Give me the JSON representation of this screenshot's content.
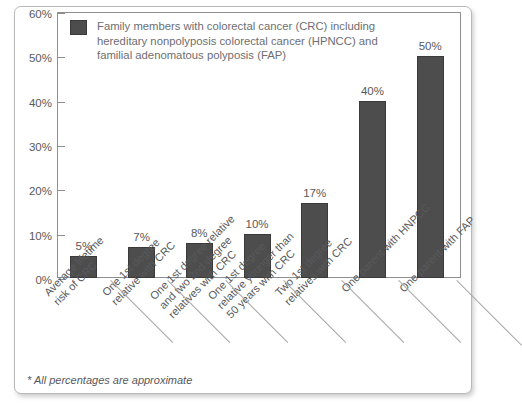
{
  "chart_data": {
    "type": "bar",
    "title": "",
    "xlabel": "",
    "ylabel": "",
    "ylim": [
      0,
      60
    ],
    "grid": false,
    "legend_position": "top-left",
    "bar_color": "#4d4d4d",
    "categories": [
      "Average lifetime risk of CRC",
      "One 1st degree relative with CRC",
      "One 1st degree relative and two 2nd degree relatives with CRC",
      "One 1st degree relative younger than 50 years with CRC",
      "Two 1st degree relatives with CRC",
      "One parent with HNPCC",
      "One parent with FAP"
    ],
    "category_lines": [
      [
        "Average lifetime",
        "risk of CRC"
      ],
      [
        "One 1st degree",
        "relative with CRC"
      ],
      [
        "One 1st degree relative",
        "and two 2nd degree",
        "relatives with CRC"
      ],
      [
        "One 1st degree",
        "relative younger than",
        "50 years with CRC"
      ],
      [
        "Two 1st degree",
        "relatives with CRC"
      ],
      [
        "One parent with HNPCC"
      ],
      [
        "One parent with FAP"
      ]
    ],
    "values": [
      5,
      7,
      8,
      10,
      17,
      40,
      50
    ],
    "value_labels": [
      "5%",
      "7%",
      "8%",
      "10%",
      "17%",
      "40%",
      "50%"
    ],
    "ytick_values": [
      0,
      10,
      20,
      30,
      40,
      50,
      60
    ],
    "ytick_labels": [
      "0%",
      "10%",
      "20%",
      "30%",
      "40%",
      "50%",
      "60%"
    ],
    "legend": [
      {
        "label": "Family members with colorectal cancer (CRC) including hereditary nonpolyposis colorectal cancer (HPNCC) and familial adenomatous polyposis (FAP)",
        "lines": [
          "Family members with colorectal cancer (CRC) including",
          "hereditary nonpolyposis colorectal cancer (HPNCC) and",
          "familial adenomatous polyposis (FAP)"
        ],
        "color": "#4d4d4d"
      }
    ],
    "footnote": "* All percentages are approximate"
  }
}
